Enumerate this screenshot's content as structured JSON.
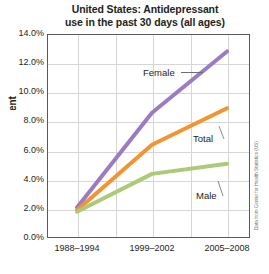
{
  "chart_data": {
    "type": "line",
    "title": "United States: Antidepressant use in the past 30 days (all ages)",
    "title_line1": "United States: Antidepressant",
    "title_line2": "use in the past 30 days (all ages)",
    "xlabel": "",
    "ylabel": "Percentages",
    "categories": [
      "1988–1994",
      "1999–2002",
      "2005–2008"
    ],
    "series": [
      {
        "name": "Female",
        "values": [
          2.1,
          8.6,
          12.8
        ],
        "color": "#9b7cc4"
      },
      {
        "name": "Total",
        "values": [
          1.9,
          6.4,
          8.9
        ],
        "color": "#f3952f"
      },
      {
        "name": "Male",
        "values": [
          1.8,
          4.4,
          5.1
        ],
        "color": "#aec977"
      }
    ],
    "ylim": [
      0,
      14
    ],
    "ytick_labels": [
      "14.0%",
      "12.0%",
      "10.0%",
      "8.0%",
      "6.0%",
      "4.0%",
      "2.0%",
      "0.0%"
    ],
    "ytick_values": [
      14,
      12,
      10,
      8,
      6,
      4,
      2,
      0
    ],
    "grid": true,
    "legend_position": "inline-annotations"
  },
  "source": {
    "credit": "Data from Center for Health Statistics  (US)"
  }
}
